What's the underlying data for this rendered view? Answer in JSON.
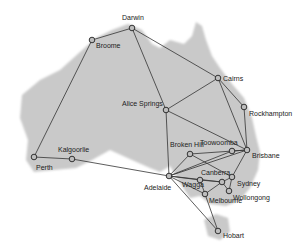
{
  "colors": {
    "land": "#c9c9c9",
    "edge": "#333333",
    "node_fill": "#bdbdbd",
    "node_stroke": "#222222",
    "label": "#222222"
  },
  "nodes": [
    {
      "id": "darwin",
      "label": "Darwin",
      "x": 132,
      "y": 28,
      "lx": 122,
      "ly": 20
    },
    {
      "id": "broome",
      "label": "Broome",
      "x": 92,
      "y": 40,
      "lx": 96,
      "ly": 48
    },
    {
      "id": "cairns",
      "label": "Cairns",
      "x": 218,
      "y": 78,
      "lx": 223,
      "ly": 81
    },
    {
      "id": "rockhampton",
      "label": "Rockhampton",
      "x": 244,
      "y": 107,
      "lx": 249,
      "ly": 116
    },
    {
      "id": "alice",
      "label": "Alice Springs",
      "x": 166,
      "y": 110,
      "lx": 122,
      "ly": 106
    },
    {
      "id": "brisbane",
      "label": "Brisbane",
      "x": 247,
      "y": 150,
      "lx": 252,
      "ly": 158
    },
    {
      "id": "toowoomba",
      "label": "Toowoomba",
      "x": 232,
      "y": 151,
      "lx": 200,
      "ly": 145
    },
    {
      "id": "brokenhill",
      "label": "Broken Hill",
      "x": 190,
      "y": 154,
      "lx": 170,
      "ly": 147
    },
    {
      "id": "perth",
      "label": "Perth",
      "x": 34,
      "y": 157,
      "lx": 36,
      "ly": 170
    },
    {
      "id": "kalgoorlie",
      "label": "Kalgoorlie",
      "x": 72,
      "y": 159,
      "lx": 58,
      "ly": 152
    },
    {
      "id": "adelaide",
      "label": "Adelaide",
      "x": 169,
      "y": 176,
      "lx": 144,
      "ly": 190
    },
    {
      "id": "wagga",
      "label": "Wagga",
      "x": 200,
      "y": 180,
      "lx": 182,
      "ly": 187
    },
    {
      "id": "canberra",
      "label": "Canberra",
      "x": 222,
      "y": 182,
      "lx": 201,
      "ly": 175
    },
    {
      "id": "sydney",
      "label": "Sydney",
      "x": 232,
      "y": 177,
      "lx": 237,
      "ly": 186
    },
    {
      "id": "wollongong",
      "label": "Wollongong",
      "x": 229,
      "y": 191,
      "lx": 233,
      "ly": 200
    },
    {
      "id": "melbourne",
      "label": "Melbourne",
      "x": 205,
      "y": 194,
      "lx": 209,
      "ly": 203
    },
    {
      "id": "hobart",
      "label": "Hobart",
      "x": 218,
      "y": 231,
      "lx": 223,
      "ly": 238
    }
  ],
  "edges": [
    [
      "broome",
      "darwin"
    ],
    [
      "broome",
      "perth"
    ],
    [
      "darwin",
      "alice"
    ],
    [
      "darwin",
      "cairns"
    ],
    [
      "cairns",
      "alice"
    ],
    [
      "cairns",
      "rockhampton"
    ],
    [
      "cairns",
      "brisbane"
    ],
    [
      "rockhampton",
      "brisbane"
    ],
    [
      "alice",
      "brisbane"
    ],
    [
      "alice",
      "adelaide"
    ],
    [
      "perth",
      "kalgoorlie"
    ],
    [
      "kalgoorlie",
      "adelaide"
    ],
    [
      "adelaide",
      "brokenhill"
    ],
    [
      "adelaide",
      "toowoomba"
    ],
    [
      "adelaide",
      "brisbane"
    ],
    [
      "adelaide",
      "wagga"
    ],
    [
      "adelaide",
      "canberra"
    ],
    [
      "adelaide",
      "melbourne"
    ],
    [
      "adelaide",
      "hobart"
    ],
    [
      "brokenhill",
      "brisbane"
    ],
    [
      "brokenhill",
      "sydney"
    ],
    [
      "toowoomba",
      "brisbane"
    ],
    [
      "brisbane",
      "sydney"
    ],
    [
      "wagga",
      "melbourne"
    ],
    [
      "wagga",
      "canberra"
    ],
    [
      "canberra",
      "sydney"
    ],
    [
      "canberra",
      "wollongong"
    ],
    [
      "canberra",
      "melbourne"
    ],
    [
      "sydney",
      "wollongong"
    ],
    [
      "melbourne",
      "hobart"
    ]
  ]
}
